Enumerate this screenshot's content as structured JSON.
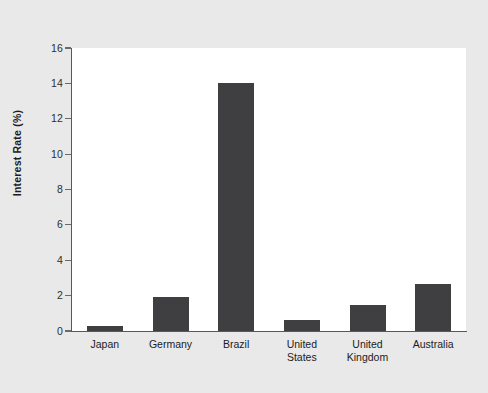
{
  "caption": {
    "strip_text": ""
  },
  "chart_data": {
    "type": "bar",
    "title": "",
    "subtitle": "",
    "xlabel": "",
    "ylabel": "Interest Rate (%)",
    "categories": [
      "Japan",
      "Germany",
      "Brazil",
      "United States",
      "United Kingdom",
      "Australia"
    ],
    "category_lines": [
      [
        "Japan"
      ],
      [
        "Germany"
      ],
      [
        "Brazil"
      ],
      [
        "United",
        "States"
      ],
      [
        "United",
        "Kingdom"
      ],
      [
        "Australia"
      ]
    ],
    "values": [
      0.3,
      1.9,
      14.0,
      0.65,
      1.45,
      2.65
    ],
    "ylim": [
      0,
      16
    ],
    "ytick_labels": [
      "0",
      "2",
      "4",
      "6",
      "8",
      "10",
      "12",
      "14",
      "16"
    ],
    "ytick_values": [
      0,
      2,
      4,
      6,
      8,
      10,
      12,
      14,
      16
    ],
    "grid": false,
    "legend": "none",
    "bar_color": "#3f3f41",
    "plot_background": "#ffffff",
    "figure_background": "#e9e9e9",
    "axis_color": "#58585a"
  }
}
